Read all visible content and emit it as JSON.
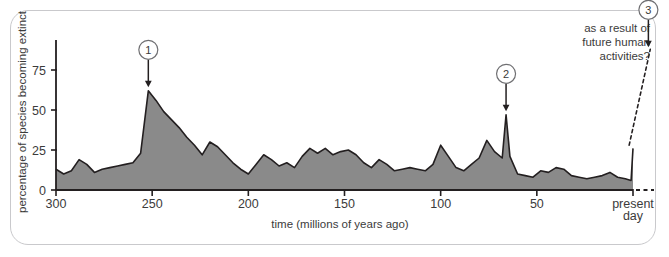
{
  "figure": {
    "background_color": "#ffffff",
    "border_color": "#c9c9cc",
    "axis_color": "#231f20",
    "area_fill_color": "#8a8a8a",
    "area_stroke_color": "#231f20",
    "text_color": "#3b3b3b"
  },
  "axes": {
    "y_title": "percentage of species becoming extinct",
    "x_title": "time (millions of years ago)",
    "y_ticks": [
      "0",
      "25",
      "50",
      "75"
    ],
    "y_tick_values": [
      0,
      25,
      50,
      75
    ],
    "x_ticks": [
      "300",
      "250",
      "200",
      "150",
      "100",
      "50"
    ],
    "x_tick_values": [
      300,
      250,
      200,
      150,
      100,
      50
    ],
    "x_end_label_line1": "present",
    "x_end_label_line2": "day"
  },
  "annotations": {
    "callouts": [
      {
        "id": "1",
        "label": "1",
        "x_value": 252,
        "y_value": 62
      },
      {
        "id": "2",
        "label": "2",
        "x_value": 66,
        "y_value": 47
      },
      {
        "id": "3",
        "label": "3",
        "x_value": -8,
        "y_value": 87
      }
    ],
    "future_note_line1": "as a result of",
    "future_note_line2": "future human",
    "future_note_line3": "activities?"
  },
  "chart_data": {
    "type": "area",
    "title": "",
    "subtitle": "",
    "xlabel": "time (millions of years ago)",
    "ylabel": "percentage of species becoming extinct",
    "xlim": [
      300,
      0
    ],
    "ylim": [
      0,
      85
    ],
    "x_axis_inverted": true,
    "grid": false,
    "legend": null,
    "series": [
      {
        "name": "percentage of species becoming extinct",
        "fill": "#8a8a8a",
        "x": [
          300,
          296,
          292,
          288,
          284,
          280,
          276,
          272,
          268,
          264,
          260,
          256,
          252,
          248,
          244,
          240,
          236,
          232,
          228,
          224,
          220,
          216,
          212,
          208,
          204,
          200,
          196,
          192,
          188,
          184,
          180,
          176,
          172,
          168,
          164,
          160,
          156,
          152,
          148,
          144,
          140,
          136,
          132,
          128,
          124,
          120,
          116,
          112,
          108,
          104,
          100,
          96,
          92,
          88,
          84,
          80,
          76,
          72,
          68,
          66,
          64,
          60,
          56,
          52,
          48,
          44,
          40,
          36,
          32,
          28,
          24,
          20,
          16,
          12,
          8,
          4,
          1,
          0
        ],
        "y": [
          13,
          10,
          12,
          19,
          16,
          11,
          13,
          14,
          15,
          16,
          17,
          23,
          62,
          56,
          49,
          44,
          39,
          33,
          28,
          22,
          30,
          27,
          22,
          17,
          13,
          10,
          16,
          22,
          19,
          15,
          17,
          14,
          21,
          26,
          23,
          26,
          22,
          24,
          25,
          22,
          17,
          14,
          19,
          16,
          12,
          13,
          14,
          13,
          12,
          16,
          28,
          21,
          14,
          12,
          16,
          20,
          31,
          24,
          20,
          47,
          21,
          10,
          9,
          8,
          12,
          11,
          14,
          13,
          9,
          8,
          7,
          8,
          9,
          11,
          8,
          7,
          6,
          26
        ],
        "peak_markers": [
          {
            "callout": "1",
            "x": 252,
            "y": 62
          },
          {
            "callout": "2",
            "x": 66,
            "y": 47
          }
        ]
      }
    ],
    "projection": {
      "style": "dashed",
      "description": "future projection rising steeply after present day",
      "x": [
        2,
        -9
      ],
      "y": [
        28,
        88
      ]
    },
    "baseline_extension": {
      "style": "dashed",
      "description": "dashed zero-line extending past present day"
    }
  }
}
